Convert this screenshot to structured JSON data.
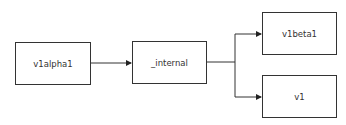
{
  "diagram": {
    "type": "flowchart",
    "nodes": [
      {
        "id": "v1alpha1",
        "label": "v1alpha1"
      },
      {
        "id": "internal",
        "label": "_internal"
      },
      {
        "id": "v1beta1",
        "label": "v1beta1"
      },
      {
        "id": "v1",
        "label": "v1"
      }
    ],
    "edges": [
      {
        "from": "v1alpha1",
        "to": "internal"
      },
      {
        "from": "internal",
        "to": "v1beta1"
      },
      {
        "from": "internal",
        "to": "v1"
      }
    ],
    "colors": {
      "stroke": "#333333",
      "background": "#ffffff",
      "text": "#333333"
    }
  }
}
